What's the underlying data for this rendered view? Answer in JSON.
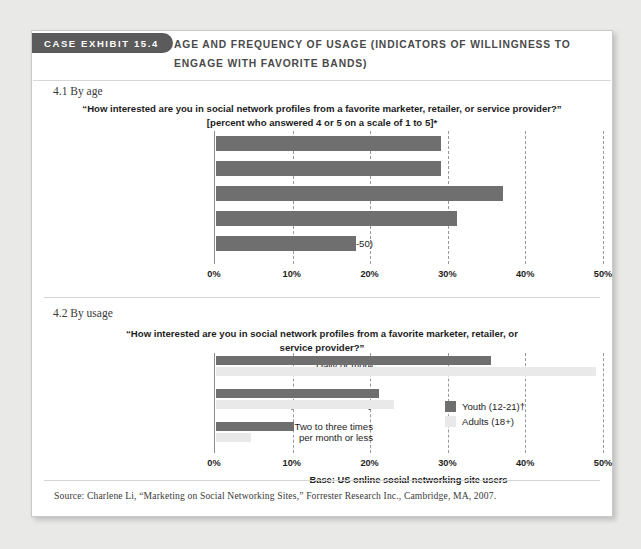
{
  "exhibit": {
    "tab_label": "CASE EXHIBIT  15.4",
    "title": "AGE AND FREQUENCY OF USAGE (INDICATORS OF WILLINGNESS TO ENGAGE WITH FAVORITE BANDS)",
    "source": "Source: Charlene Li, “Marketing on Social Networking Sites,” Forrester Research Inc., Cambridge, MA, 2007."
  },
  "sections": {
    "one_label": "4.1 By age",
    "two_label": "4.2 By usage"
  },
  "colors": {
    "dark_bar": "#6f6f6f",
    "light_bar": "#e9e9e9",
    "tab_bg": "#5b5b5b",
    "title_text": "#4a4a4a",
    "card_bg": "#ffffff",
    "page_bg": "#e9e9e7"
  },
  "chart_data": [
    {
      "type": "bar",
      "id": "by-age",
      "orientation": "horizontal",
      "title": "“How interested are you in social network profiles from a favorite marketer, retailer, or service provider?” [percent who answered 4 or 5 on a scale of 1 to 5]*",
      "categories": [
        "Teenagers (12-17)†",
        "Young Adults (18-21)†",
        "Gen Yers (18-26)",
        "Gen Xers (27-40)",
        "Younger Boomers (41-50)"
      ],
      "values": [
        29,
        29,
        37,
        31,
        18
      ],
      "xlabel": "",
      "ylabel": "",
      "xlim": [
        0,
        50
      ],
      "xticks": [
        0,
        10,
        20,
        30,
        40,
        50
      ],
      "xticklabels": [
        "0%",
        "10%",
        "20%",
        "30%",
        "40%",
        "50%"
      ],
      "grid": "vertical-dashed",
      "legend": "none"
    },
    {
      "type": "bar",
      "id": "by-usage",
      "orientation": "horizontal",
      "title": "“How interested are you in social network profiles from a favorite marketer, retailer, or service provider?”",
      "categories": [
        "Daily or more",
        "Two to three times\nper week or weekly",
        "Two to three times\nper month or less"
      ],
      "series": [
        {
          "name": "Youth (12-21)†",
          "values": [
            35.5,
            21,
            10
          ],
          "color": "#6f6f6f"
        },
        {
          "name": "Adults (18+)",
          "values": [
            49,
            23,
            4.5
          ],
          "color": "#e9e9e9"
        }
      ],
      "xlabel": "Base: US online social networking site users",
      "ylabel": "",
      "xlim": [
        0,
        50
      ],
      "xticks": [
        0,
        10,
        20,
        30,
        40,
        50
      ],
      "xticklabels": [
        "0%",
        "10%",
        "20%",
        "30%",
        "40%",
        "50%"
      ],
      "grid": "vertical-dashed",
      "legend": "inside-right"
    }
  ]
}
